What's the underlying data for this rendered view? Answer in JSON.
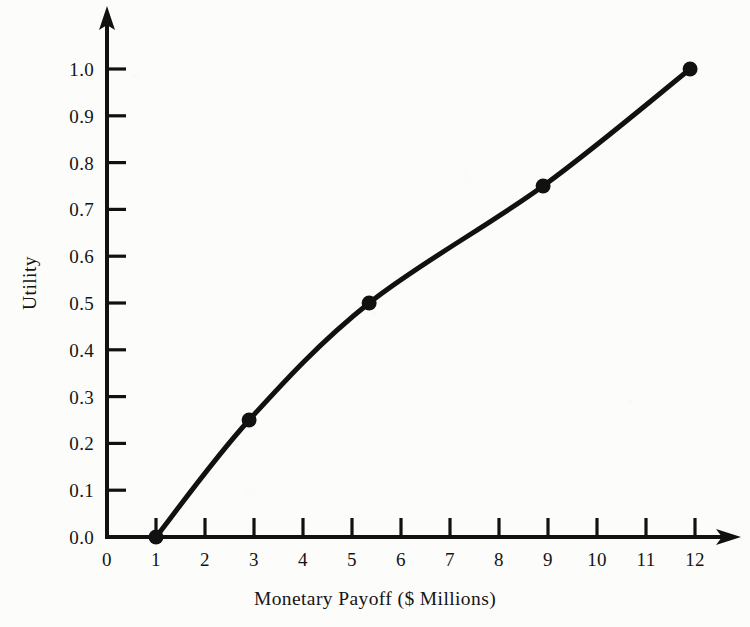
{
  "chart_data": {
    "type": "line",
    "title": "",
    "subtitle": "",
    "xlabel": "Monetary Payoff ($ Millions)",
    "ylabel": "Utility",
    "xlim": [
      0,
      12
    ],
    "ylim": [
      0.0,
      1.0
    ],
    "grid": false,
    "legend": null,
    "xticks": [
      "0",
      "1",
      "2",
      "3",
      "4",
      "5",
      "6",
      "7",
      "8",
      "9",
      "10",
      "11",
      "12"
    ],
    "xtick_values": [
      0,
      1,
      2,
      3,
      4,
      5,
      6,
      7,
      8,
      9,
      10,
      11,
      12
    ],
    "yticks": [
      "0.0",
      "0.1",
      "0.2",
      "0.3",
      "0.4",
      "0.5",
      "0.6",
      "0.7",
      "0.8",
      "0.9",
      "1.0"
    ],
    "ytick_values": [
      0.0,
      0.1,
      0.2,
      0.3,
      0.4,
      0.5,
      0.6,
      0.7,
      0.8,
      0.9,
      1.0
    ],
    "series": [
      {
        "name": "Utility curve",
        "marker": "filled-circle",
        "line": "solid",
        "color": "#111111",
        "x": [
          1.0,
          2.9,
          5.35,
          8.9,
          11.9
        ],
        "y": [
          0.0,
          0.25,
          0.5,
          0.75,
          1.0
        ]
      }
    ],
    "points": [
      {
        "x": 1.0,
        "y": 0.0
      },
      {
        "x": 2.9,
        "y": 0.25
      },
      {
        "x": 5.35,
        "y": 0.5
      },
      {
        "x": 8.9,
        "y": 0.75
      },
      {
        "x": 11.9,
        "y": 1.0
      }
    ],
    "axis_style": {
      "x_axis_arrow": true,
      "y_axis_arrow": true,
      "spines": [
        "left",
        "bottom"
      ],
      "tick_direction": "out",
      "line_color": "#111111",
      "background": "#fcfcfa"
    }
  }
}
